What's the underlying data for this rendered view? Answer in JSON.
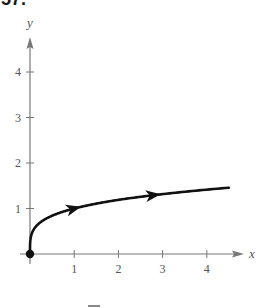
{
  "problem": {
    "number": "57."
  },
  "chart_data": {
    "type": "line",
    "title": "",
    "xlabel": "x",
    "ylabel": "y",
    "xlim": [
      -0.3,
      4.9
    ],
    "ylim": [
      -0.3,
      4.9
    ],
    "x_ticks": [
      1,
      2,
      3,
      4
    ],
    "y_ticks": [
      1,
      2,
      3,
      4
    ],
    "grid": false,
    "legend": null,
    "series": [
      {
        "name": "curve",
        "description": "y = x^(1/4), starting at the origin (filled dot) with direction arrows pointing right",
        "x": [
          0,
          0.01,
          0.05,
          0.1,
          0.25,
          0.5,
          1,
          1.5,
          2,
          2.5,
          3,
          3.5,
          4,
          4.5
        ],
        "values": [
          0,
          0.32,
          0.47,
          0.56,
          0.71,
          0.84,
          1.0,
          1.11,
          1.19,
          1.26,
          1.32,
          1.37,
          1.41,
          1.46
        ],
        "start_point": [
          0,
          0
        ],
        "arrows_at_x": [
          1,
          2.8
        ]
      }
    ]
  }
}
